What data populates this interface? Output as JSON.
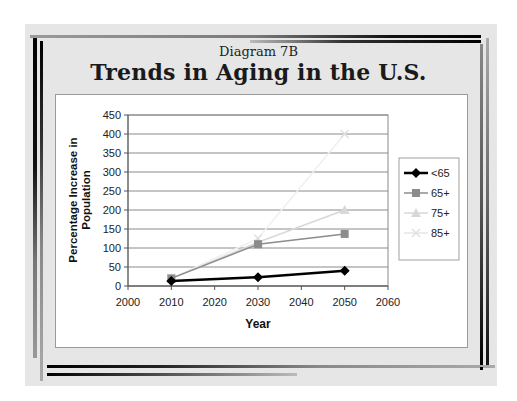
{
  "slide": {
    "subtitle": "Diagram 7B",
    "title": "Trends in Aging in the U.S."
  },
  "chart_data": {
    "type": "line",
    "title": "Trends in Aging in the U.S.",
    "subtitle": "Diagram 7B",
    "xlabel": "Year",
    "ylabel": "Percentage Increase in Population",
    "ylabel_lines": [
      "Percentage Increase in",
      "Population"
    ],
    "xlim": [
      2000,
      2060
    ],
    "ylim": [
      0,
      450
    ],
    "x_ticks": [
      2000,
      2010,
      2020,
      2030,
      2040,
      2050,
      2060
    ],
    "y_ticks": [
      0,
      50,
      100,
      150,
      200,
      250,
      300,
      350,
      400,
      450
    ],
    "grid": "horizontal",
    "legend_position": "right",
    "x": [
      2010,
      2030,
      2050
    ],
    "series": [
      {
        "name": "<65",
        "values": [
          13,
          23,
          40
        ],
        "color": "#000000",
        "marker": "diamond"
      },
      {
        "name": "65+",
        "values": [
          20,
          110,
          137
        ],
        "color": "#8c8c8c",
        "marker": "square"
      },
      {
        "name": "75+",
        "values": [
          20,
          115,
          200
        ],
        "color": "#d8d8d8",
        "marker": "triangle"
      },
      {
        "name": "85+",
        "values": [
          20,
          125,
          400
        ],
        "color": "#efefef",
        "marker": "x"
      }
    ]
  }
}
